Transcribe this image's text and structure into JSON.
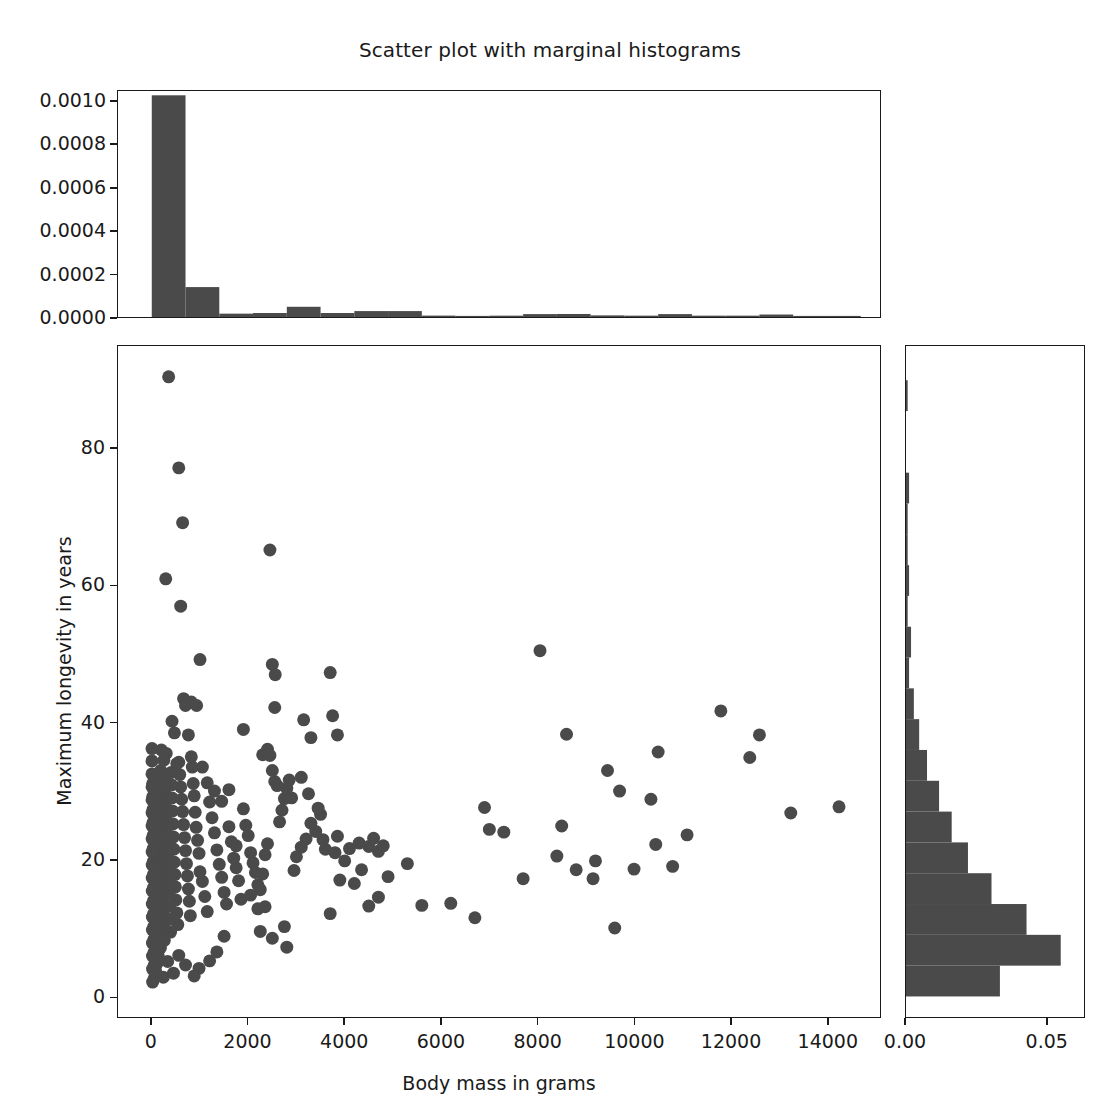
{
  "figure": {
    "title": "Scatter plot with marginal histograms",
    "background": "#ffffff",
    "marker_color": "#4a4a4a",
    "bar_color": "#4a4a4a",
    "axis_color": "#1a1a1a"
  },
  "axes": {
    "x_title": "Body mass in grams",
    "y_title": "Maximum longevity in years",
    "x_ticks": [
      "0",
      "2000",
      "4000",
      "6000",
      "8000",
      "10000",
      "12000",
      "14000"
    ],
    "y_ticks": [
      "0",
      "20",
      "40",
      "60",
      "80"
    ],
    "top_hist_y_ticks": [
      "0.0000",
      "0.0002",
      "0.0004",
      "0.0006",
      "0.0008",
      "0.0010"
    ],
    "right_hist_x_ticks": [
      "0.00",
      "0.05"
    ]
  },
  "chart_data": {
    "type": "scatter",
    "title": "Scatter plot with marginal histograms",
    "xlabel": "Body mass in grams",
    "ylabel": "Maximum longevity in years",
    "xlim": [
      -700,
      15100
    ],
    "ylim": [
      -3,
      95
    ],
    "grid": false,
    "legend": null,
    "marker_color": "#4a4a4a",
    "marker_size": 13,
    "points": [
      [
        350,
        90.5
      ],
      [
        290,
        61.0
      ],
      [
        560,
        77.2
      ],
      [
        640,
        69.2
      ],
      [
        600,
        57.0
      ],
      [
        1000,
        49.2
      ],
      [
        2450,
        65.2
      ],
      [
        2500,
        48.5
      ],
      [
        2560,
        47.0
      ],
      [
        3700,
        47.3
      ],
      [
        820,
        43.0
      ],
      [
        660,
        43.5
      ],
      [
        700,
        42.5
      ],
      [
        930,
        42.5
      ],
      [
        8050,
        50.5
      ],
      [
        1900,
        39.0
      ],
      [
        2300,
        35.3
      ],
      [
        2400,
        36.1
      ],
      [
        2550,
        42.2
      ],
      [
        3150,
        40.4
      ],
      [
        3300,
        37.8
      ],
      [
        3750,
        41.0
      ],
      [
        3850,
        38.2
      ],
      [
        8600,
        38.3
      ],
      [
        10500,
        35.7
      ],
      [
        11800,
        41.7
      ],
      [
        12600,
        38.2
      ],
      [
        12400,
        34.9
      ],
      [
        9450,
        33.0
      ],
      [
        10350,
        28.8
      ],
      [
        9700,
        30.0
      ],
      [
        13250,
        26.8
      ],
      [
        14250,
        27.7
      ],
      [
        11100,
        23.6
      ],
      [
        10450,
        22.2
      ],
      [
        9600,
        10.0
      ],
      [
        8400,
        20.5
      ],
      [
        8500,
        24.9
      ],
      [
        8800,
        18.5
      ],
      [
        9150,
        17.2
      ],
      [
        9200,
        19.8
      ],
      [
        10000,
        18.6
      ],
      [
        10800,
        19.0
      ],
      [
        7700,
        17.2
      ],
      [
        7300,
        24.0
      ],
      [
        7000,
        24.4
      ],
      [
        6900,
        27.6
      ],
      [
        6700,
        11.5
      ],
      [
        6200,
        13.6
      ],
      [
        5600,
        13.3
      ],
      [
        5300,
        19.4
      ],
      [
        4700,
        21.2
      ],
      [
        4800,
        22.0
      ],
      [
        4600,
        23.1
      ],
      [
        4500,
        21.9
      ],
      [
        4300,
        22.4
      ],
      [
        4200,
        16.5
      ],
      [
        4000,
        19.8
      ],
      [
        3900,
        17.0
      ],
      [
        3850,
        23.4
      ],
      [
        3700,
        12.1
      ],
      [
        3600,
        21.5
      ],
      [
        3500,
        26.6
      ],
      [
        3400,
        24.1
      ],
      [
        3300,
        25.3
      ],
      [
        3200,
        23.0
      ],
      [
        3100,
        21.8
      ],
      [
        3000,
        20.4
      ],
      [
        2950,
        18.4
      ],
      [
        2900,
        29.0
      ],
      [
        2850,
        31.6
      ],
      [
        2800,
        30.4
      ],
      [
        2750,
        28.9
      ],
      [
        2700,
        27.2
      ],
      [
        2650,
        25.5
      ],
      [
        2600,
        30.8
      ],
      [
        2550,
        31.4
      ],
      [
        2500,
        33.0
      ],
      [
        2450,
        35.2
      ],
      [
        2400,
        22.3
      ],
      [
        2350,
        20.7
      ],
      [
        2300,
        17.9
      ],
      [
        2250,
        15.6
      ],
      [
        2200,
        16.3
      ],
      [
        2150,
        18.1
      ],
      [
        2100,
        19.5
      ],
      [
        2050,
        21.0
      ],
      [
        2000,
        23.5
      ],
      [
        1950,
        25.0
      ],
      [
        1900,
        27.4
      ],
      [
        1850,
        14.2
      ],
      [
        1800,
        16.9
      ],
      [
        1750,
        18.8
      ],
      [
        1700,
        20.2
      ],
      [
        1650,
        22.6
      ],
      [
        1600,
        24.8
      ],
      [
        1550,
        13.5
      ],
      [
        1500,
        15.2
      ],
      [
        1450,
        17.4
      ],
      [
        1400,
        19.3
      ],
      [
        1350,
        21.4
      ],
      [
        1300,
        23.9
      ],
      [
        1250,
        26.1
      ],
      [
        1200,
        28.4
      ],
      [
        1150,
        12.4
      ],
      [
        1100,
        14.6
      ],
      [
        1050,
        16.8
      ],
      [
        1000,
        18.2
      ],
      [
        980,
        20.9
      ],
      [
        950,
        22.8
      ],
      [
        920,
        24.7
      ],
      [
        900,
        26.9
      ],
      [
        880,
        29.3
      ],
      [
        860,
        31.1
      ],
      [
        840,
        33.5
      ],
      [
        820,
        35.0
      ],
      [
        800,
        11.8
      ],
      [
        780,
        13.9
      ],
      [
        760,
        15.7
      ],
      [
        740,
        17.6
      ],
      [
        720,
        19.4
      ],
      [
        700,
        21.3
      ],
      [
        680,
        23.2
      ],
      [
        660,
        25.1
      ],
      [
        640,
        27.0
      ],
      [
        620,
        28.8
      ],
      [
        600,
        30.6
      ],
      [
        580,
        32.4
      ],
      [
        560,
        34.2
      ],
      [
        540,
        10.5
      ],
      [
        520,
        12.2
      ],
      [
        500,
        14.1
      ],
      [
        490,
        16.0
      ],
      [
        480,
        17.8
      ],
      [
        470,
        19.6
      ],
      [
        460,
        21.5
      ],
      [
        450,
        23.3
      ],
      [
        440,
        25.2
      ],
      [
        430,
        27.1
      ],
      [
        420,
        29.0
      ],
      [
        410,
        30.9
      ],
      [
        400,
        32.7
      ],
      [
        390,
        9.4
      ],
      [
        380,
        11.3
      ],
      [
        370,
        13.2
      ],
      [
        360,
        15.1
      ],
      [
        350,
        17.0
      ],
      [
        340,
        18.9
      ],
      [
        330,
        20.8
      ],
      [
        320,
        22.7
      ],
      [
        310,
        24.6
      ],
      [
        300,
        26.5
      ],
      [
        290,
        28.4
      ],
      [
        280,
        30.3
      ],
      [
        270,
        32.2
      ],
      [
        260,
        8.2
      ],
      [
        250,
        10.1
      ],
      [
        240,
        12.0
      ],
      [
        235,
        13.9
      ],
      [
        230,
        15.8
      ],
      [
        225,
        17.7
      ],
      [
        220,
        19.6
      ],
      [
        215,
        21.5
      ],
      [
        210,
        23.4
      ],
      [
        205,
        25.3
      ],
      [
        200,
        27.2
      ],
      [
        195,
        29.1
      ],
      [
        190,
        31.0
      ],
      [
        185,
        33.0
      ],
      [
        180,
        7.1
      ],
      [
        175,
        9.0
      ],
      [
        170,
        10.9
      ],
      [
        165,
        12.8
      ],
      [
        160,
        14.7
      ],
      [
        155,
        16.6
      ],
      [
        150,
        18.5
      ],
      [
        148,
        20.4
      ],
      [
        146,
        22.3
      ],
      [
        144,
        24.2
      ],
      [
        142,
        26.1
      ],
      [
        140,
        28.0
      ],
      [
        138,
        29.9
      ],
      [
        136,
        31.8
      ],
      [
        134,
        5.9
      ],
      [
        132,
        7.8
      ],
      [
        130,
        9.7
      ],
      [
        128,
        11.6
      ],
      [
        126,
        13.5
      ],
      [
        124,
        15.4
      ],
      [
        122,
        17.3
      ],
      [
        120,
        19.2
      ],
      [
        118,
        21.1
      ],
      [
        116,
        23.0
      ],
      [
        114,
        24.9
      ],
      [
        112,
        26.8
      ],
      [
        110,
        28.7
      ],
      [
        108,
        30.6
      ],
      [
        106,
        4.8
      ],
      [
        104,
        6.7
      ],
      [
        102,
        8.6
      ],
      [
        100,
        10.5
      ],
      [
        98,
        12.4
      ],
      [
        96,
        14.3
      ],
      [
        94,
        16.2
      ],
      [
        92,
        18.1
      ],
      [
        90,
        20.0
      ],
      [
        88,
        21.9
      ],
      [
        86,
        23.8
      ],
      [
        84,
        25.7
      ],
      [
        82,
        27.6
      ],
      [
        80,
        29.5
      ],
      [
        78,
        3.7
      ],
      [
        76,
        5.6
      ],
      [
        74,
        7.5
      ],
      [
        72,
        9.4
      ],
      [
        70,
        11.3
      ],
      [
        68,
        13.2
      ],
      [
        66,
        15.1
      ],
      [
        64,
        17.0
      ],
      [
        62,
        18.9
      ],
      [
        60,
        20.8
      ],
      [
        58,
        22.7
      ],
      [
        56,
        24.6
      ],
      [
        54,
        26.5
      ],
      [
        52,
        28.4
      ],
      [
        50,
        2.6
      ],
      [
        48,
        4.5
      ],
      [
        46,
        6.4
      ],
      [
        44,
        8.3
      ],
      [
        42,
        10.2
      ],
      [
        40,
        12.1
      ],
      [
        38,
        14.0
      ],
      [
        36,
        15.9
      ],
      [
        34,
        17.8
      ],
      [
        32,
        19.7
      ],
      [
        30,
        21.6
      ],
      [
        28,
        23.5
      ],
      [
        26,
        25.4
      ],
      [
        24,
        27.3
      ],
      [
        22,
        29.2
      ],
      [
        20,
        31.1
      ],
      [
        18,
        2.1
      ],
      [
        16,
        4.0
      ],
      [
        15,
        5.9
      ],
      [
        14,
        7.8
      ],
      [
        13,
        9.7
      ],
      [
        12,
        11.6
      ],
      [
        11,
        13.5
      ],
      [
        10,
        15.4
      ],
      [
        9,
        17.3
      ],
      [
        9,
        19.2
      ],
      [
        8,
        21.1
      ],
      [
        8,
        23.0
      ],
      [
        7,
        24.9
      ],
      [
        7,
        26.8
      ],
      [
        6,
        28.7
      ],
      [
        6,
        30.6
      ],
      [
        5,
        32.5
      ],
      [
        5,
        34.4
      ],
      [
        5,
        36.2
      ],
      [
        200,
        36.0
      ],
      [
        250,
        34.5
      ],
      [
        300,
        35.5
      ],
      [
        420,
        40.2
      ],
      [
        470,
        38.5
      ],
      [
        520,
        34.0
      ],
      [
        760,
        38.2
      ],
      [
        1050,
        33.5
      ],
      [
        1150,
        31.2
      ],
      [
        1300,
        30.0
      ],
      [
        1450,
        28.5
      ],
      [
        1600,
        30.2
      ],
      [
        1750,
        22.0
      ],
      [
        2050,
        14.8
      ],
      [
        2200,
        12.8
      ],
      [
        2350,
        13.1
      ],
      [
        2750,
        10.2
      ],
      [
        2800,
        7.2
      ],
      [
        2500,
        8.5
      ],
      [
        2250,
        9.5
      ],
      [
        1500,
        8.8
      ],
      [
        1350,
        6.5
      ],
      [
        1200,
        5.2
      ],
      [
        980,
        4.1
      ],
      [
        880,
        3.0
      ],
      [
        700,
        4.6
      ],
      [
        560,
        6.0
      ],
      [
        450,
        3.4
      ],
      [
        330,
        5.1
      ],
      [
        240,
        2.8
      ],
      [
        3100,
        32.0
      ],
      [
        3250,
        29.6
      ],
      [
        3450,
        27.5
      ],
      [
        3550,
        22.9
      ],
      [
        3800,
        21.0
      ],
      [
        4100,
        21.6
      ],
      [
        4350,
        18.5
      ],
      [
        4500,
        13.2
      ],
      [
        4700,
        14.5
      ],
      [
        4900,
        17.5
      ]
    ]
  },
  "top_histogram": {
    "type": "bar",
    "orientation": "vertical",
    "ylabel": "",
    "ylim": [
      0,
      0.00105
    ],
    "xlim": [
      -700,
      15100
    ],
    "density": true,
    "bin_edges": [
      0,
      700,
      1400,
      2100,
      2800,
      3500,
      4200,
      4900,
      5600,
      6300,
      7000,
      7700,
      8400,
      9100,
      9800,
      10500,
      11200,
      11900,
      12600,
      13300,
      14000,
      14700
    ],
    "values": [
      0.00103,
      0.000139,
      1.55e-05,
      1.85e-05,
      4.75e-05,
      1.85e-05,
      2.75e-05,
      2.75e-05,
      6.5e-06,
      4.5e-06,
      6.2e-06,
      1.35e-05,
      1.4e-05,
      7.5e-06,
      6.2e-06,
      1.35e-05,
      6.2e-06,
      6.2e-06,
      1.15e-05,
      3e-06,
      3e-06
    ]
  },
  "right_histogram": {
    "type": "bar",
    "orientation": "horizontal",
    "xlim": [
      0,
      0.0635
    ],
    "ylim": [
      -3,
      95
    ],
    "density": true,
    "bin_edges": [
      0,
      4.5,
      9,
      13.5,
      18,
      22.5,
      27,
      31.5,
      36,
      40.5,
      45,
      49.5,
      54,
      58.5,
      63,
      67.5,
      72,
      76.5,
      81,
      85.5,
      90
    ],
    "values": [
      0.0335,
      0.0552,
      0.043,
      0.0305,
      0.0221,
      0.0163,
      0.0118,
      0.0075,
      0.0047,
      0.0028,
      0.0011,
      0.0018,
      0.0006,
      0.0011,
      0.0006,
      0.0006,
      0.0011,
      0.0,
      0.0,
      0.0006
    ]
  }
}
